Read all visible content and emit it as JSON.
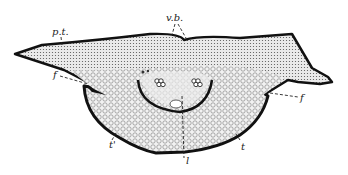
{
  "figure": {
    "colors": {
      "outline": "#111111",
      "tissue": "#d8d8d8",
      "background": "#ffffff",
      "label": "#222222"
    },
    "labels": [
      {
        "id": "pt",
        "text": "p.t.",
        "x": 52,
        "y": 35
      },
      {
        "id": "vb",
        "text": "v.b.",
        "x": 166,
        "y": 21
      },
      {
        "id": "f_left",
        "text": "f",
        "x": 53,
        "y": 78
      },
      {
        "id": "f_right",
        "text": "f",
        "x": 300,
        "y": 101
      },
      {
        "id": "t_prime",
        "text": "t'",
        "x": 109,
        "y": 143
      },
      {
        "id": "l",
        "text": "l",
        "x": 186,
        "y": 162
      },
      {
        "id": "t",
        "text": "t",
        "x": 243,
        "y": 148
      }
    ]
  }
}
